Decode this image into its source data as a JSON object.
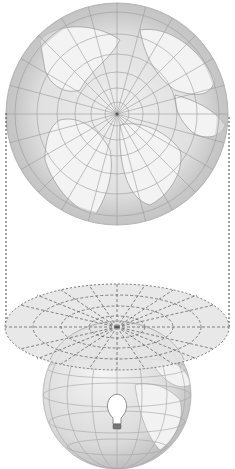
{
  "diagram": {
    "type": "map-projection-illustration",
    "colors": {
      "background": "#ffffff",
      "ocean": "#cfcfcf",
      "ocean_rim": "#bdbdbd",
      "land": "#ececec",
      "graticule": "#9a9a9a",
      "coastline": "#8a8a8a",
      "projection_plane": "#e6e6e6",
      "dashed_line": "#555555",
      "bulb": "#ffffff",
      "bulb_base": "#777777"
    },
    "top_map": {
      "center": [
        117,
        114
      ],
      "radius": 111,
      "meridians": 24,
      "parallels": 6
    },
    "projection_lines": {
      "left_x": 6,
      "right_x": 229,
      "y_start": 113,
      "y_end": 327
    },
    "projection_plane": {
      "center": [
        117,
        327
      ],
      "rx": 112,
      "ry": 43
    },
    "globe": {
      "center": [
        117,
        395
      ],
      "radius": 74
    },
    "light_source": {
      "position": [
        117,
        418
      ],
      "icon": "light-bulb-icon"
    }
  }
}
